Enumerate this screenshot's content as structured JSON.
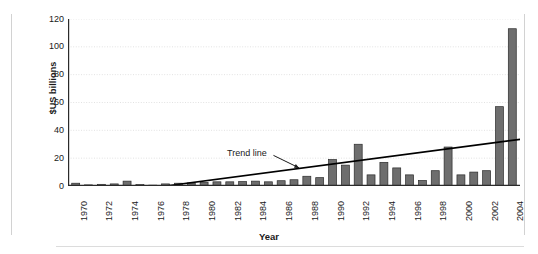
{
  "chart_data": {
    "type": "bar",
    "title": "",
    "subtitle": "",
    "xlabel": "Year",
    "ylabel": "$US billions",
    "ylim": [
      0,
      120
    ],
    "yticks": [
      0,
      20,
      40,
      60,
      80,
      100,
      120
    ],
    "xlim": [
      1969.4,
      2004.6
    ],
    "xticks": [
      1970,
      1972,
      1974,
      1976,
      1978,
      1980,
      1982,
      1984,
      1986,
      1988,
      1990,
      1992,
      1994,
      1996,
      1998,
      2000,
      2002,
      2004
    ],
    "xtick_labels": [
      "1970",
      "1972",
      "1974",
      "1976",
      "1978",
      "1980",
      "1982",
      "1984",
      "1986",
      "1988",
      "1990",
      "1992",
      "1994",
      "1996",
      "1998",
      "2000",
      "2002",
      "2004"
    ],
    "grid": "horizontal-dotted",
    "legend_position": "none",
    "categories": [
      1970,
      1971,
      1972,
      1973,
      1974,
      1975,
      1976,
      1977,
      1978,
      1979,
      1980,
      1981,
      1982,
      1983,
      1984,
      1985,
      1986,
      1987,
      1988,
      1989,
      1990,
      1991,
      1992,
      1993,
      1994,
      1995,
      1996,
      1997,
      1998,
      1999,
      2000,
      2001,
      2002,
      2003,
      2004
    ],
    "values": [
      2.0,
      0.8,
      1.2,
      1.5,
      3.5,
      1.0,
      0.6,
      1.5,
      2.0,
      2.2,
      2.5,
      3.0,
      3.0,
      3.2,
      3.5,
      3.0,
      3.8,
      4.5,
      7.0,
      6.0,
      19.0,
      15.0,
      30.0,
      8.0,
      17.0,
      13.0,
      8.0,
      4.0,
      11.0,
      28.0,
      8.0,
      10.0,
      11.0,
      57.0,
      113.0
    ],
    "series": [
      {
        "name": "Annual value",
        "color": "#6e6e6e",
        "values": [
          2.0,
          0.8,
          1.2,
          1.5,
          3.5,
          1.0,
          0.6,
          1.5,
          2.0,
          2.2,
          2.5,
          3.0,
          3.0,
          3.2,
          3.5,
          3.0,
          3.8,
          4.5,
          7.0,
          6.0,
          19.0,
          15.0,
          30.0,
          8.0,
          17.0,
          13.0,
          8.0,
          4.0,
          11.0,
          28.0,
          8.0,
          10.0,
          11.0,
          57.0,
          113.0
        ]
      }
    ],
    "trend_line": {
      "label": "Trend line",
      "color": "#000000",
      "x_start": 1977.0,
      "y_start": 0.0,
      "x_end": 2004.6,
      "y_end": 33.5
    },
    "annotations": [
      {
        "text": "Trend line",
        "x": 1983.5,
        "y": 24.0
      }
    ],
    "colors": {
      "bar_fill": "#6e6e6e",
      "bar_edge": "#2b2b2b",
      "axis": "#2b2b2b",
      "grid": "#e2e2e2",
      "text": "#1a1a1a",
      "frame_rule": "#d2d2d2",
      "background": "#ffffff"
    }
  }
}
